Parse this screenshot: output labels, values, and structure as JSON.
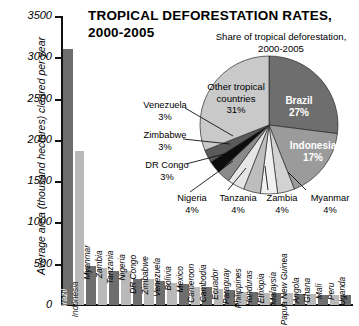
{
  "title": {
    "line1": "TROPICAL DEFORESTATION RATES,",
    "line2": "2000-2005"
  },
  "pie_subtitle": {
    "line1": "Share of tropical deforestation,",
    "line2": "2000-2005"
  },
  "axis": {
    "ylabel": "Average area (thousand hectares) cleared per year",
    "yticks": [
      "3500",
      "3000",
      "2500",
      "2000",
      "1500",
      "1000",
      "500",
      "0"
    ]
  },
  "colors": {
    "bar_dark": "#6e6e6e",
    "bar_light": "#b9b9b9",
    "pie_brazil": "#6e6e6e",
    "pie_indonesia": "#9b9b9b",
    "pie_other": "#c9c9c9",
    "pie_black": "#0d0d0d",
    "axis": "#111111"
  },
  "chart_data": [
    {
      "type": "bar",
      "title": "TROPICAL DEFORESTATION RATES, 2000-2005",
      "xlabel": "",
      "ylabel": "Average area (thousand hectares) cleared per year",
      "ylim": [
        0,
        3500
      ],
      "grid": false,
      "categories": [
        "Brazil",
        "Indonesia",
        "Myanmar",
        "Zambia",
        "Tanzania",
        "Nigeria",
        "DR Congo",
        "Zimbabwe",
        "Venezuela",
        "Bolivia",
        "Mexico",
        "Cameroon",
        "Cambodia",
        "Ecuador",
        "Paraguay",
        "Philippines",
        "Honduras",
        "Ethiopia",
        "Malaysia",
        "Papua New Guinea",
        "Angola",
        "Ghana",
        "Mali",
        "Peru",
        "Uganda"
      ],
      "values": [
        3100,
        1870,
        470,
        450,
        410,
        410,
        320,
        310,
        290,
        270,
        260,
        220,
        220,
        200,
        180,
        160,
        160,
        150,
        150,
        140,
        130,
        130,
        120,
        120,
        120
      ]
    },
    {
      "type": "pie",
      "title": "Share of tropical deforestation, 2000-2005",
      "legend_position": "callouts",
      "labels": [
        "Brazil",
        "Indonesia",
        "Myanmar",
        "Zambia",
        "Tanzania",
        "Nigeria",
        "DR Congo",
        "Zimbabwe",
        "Venezuela",
        "Other tropical countries"
      ],
      "values": [
        27,
        17,
        4,
        4,
        4,
        4,
        3,
        3,
        3,
        31
      ],
      "value_labels": [
        "27%",
        "17%",
        "4%",
        "4%",
        "4%",
        "4%",
        "3%",
        "3%",
        "3%",
        "31%"
      ]
    }
  ],
  "pie_inside_labels": [
    {
      "name": "Brazil",
      "pct": "27%"
    },
    {
      "name": "Indonesia",
      "pct": "17%"
    },
    {
      "name": "Other tropical",
      "name2": "countries",
      "pct": "31%"
    }
  ],
  "pie_callouts": [
    {
      "name": "Venezuela",
      "pct": "3%"
    },
    {
      "name": "Zimbabwe",
      "pct": "3%"
    },
    {
      "name": "DR Congo",
      "pct": "3%"
    },
    {
      "name": "Nigeria",
      "pct": "4%"
    },
    {
      "name": "Tanzania",
      "pct": "4%"
    },
    {
      "name": "Zambia",
      "pct": "4%"
    },
    {
      "name": "Myanmar",
      "pct": "4%"
    }
  ]
}
